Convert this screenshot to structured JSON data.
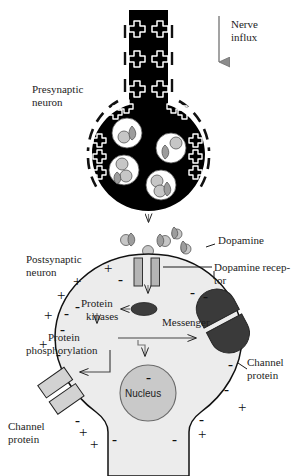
{
  "figure": {
    "type": "biology-diagram"
  },
  "labels": {
    "nerve_influx_line1": "Nerve",
    "nerve_influx_line2": "influx",
    "presynaptic_line1": "Presynaptic",
    "presynaptic_line2": "neuron",
    "dopamine": "Dopamine",
    "postsynaptic_line1": "Postsynaptic",
    "postsynaptic_line2": "neuron",
    "dopamine_receptor_line1": "Dopamine recep-",
    "dopamine_receptor_line2": "tor",
    "protein_kinases_line1": "Protein",
    "protein_kinases_line2": "kinases",
    "protein_phosphorylation_line1": "Protein",
    "protein_phosphorylation_line2": "phosphorylation",
    "messenger": "Messenger",
    "channel_protein_right_line1": "Channel",
    "channel_protein_right_line2": "protein",
    "channel_protein_left_line1": "Channel",
    "channel_protein_left_line2": "protein",
    "nucleus": "Nucleus"
  },
  "colors": {
    "terminal_fill": "#000000",
    "cell_fill": "#ececec",
    "nucleus_fill": "#c9c9c9",
    "vesicle_fill": "#ffffff",
    "dopamine_fill": "#c6c6c6",
    "receptor_fill": "#b5b5b5",
    "channel_dark": "#3a3a3a",
    "channel_light": "#d2d2d2",
    "messenger_fill": "#3d3d3d",
    "outline": "#111111",
    "background": "#ffffff"
  },
  "charges": {
    "axon_plus_count": 6,
    "terminal_plus_count": 10,
    "outside_plus_count": 9,
    "inside_minus_count": 12,
    "plus_symbol": "+",
    "minus_symbol": "-"
  },
  "structures": {
    "vesicle_count": 4,
    "cleft_dopamine_count": 5,
    "receptor_bar_count": 2,
    "channel_protein_count": 2
  }
}
